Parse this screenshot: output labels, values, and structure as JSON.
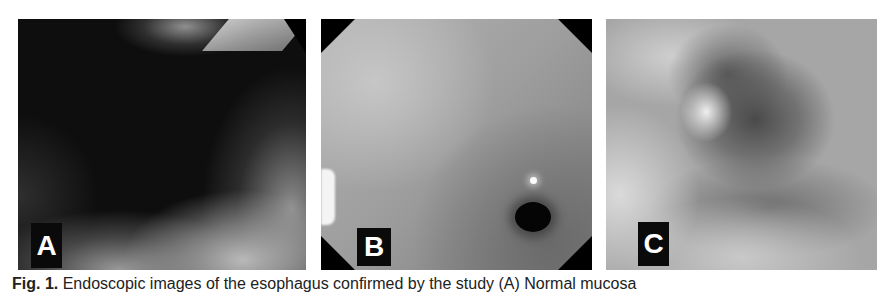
{
  "figure": {
    "panels": [
      {
        "id": "A",
        "label": "A",
        "description": "endoscopic view, dark lumen with mucosal folds"
      },
      {
        "id": "B",
        "label": "B",
        "description": "endoscopic view, smooth mucosa with dark orifice"
      },
      {
        "id": "C",
        "label": "C",
        "description": "endoscopic view, irregular mucosa with lesion"
      }
    ],
    "caption": {
      "fig_label": "Fig. 1.",
      "text": "Endoscopic images of the esophagus confirmed by the study (A) Normal mucosa"
    }
  }
}
